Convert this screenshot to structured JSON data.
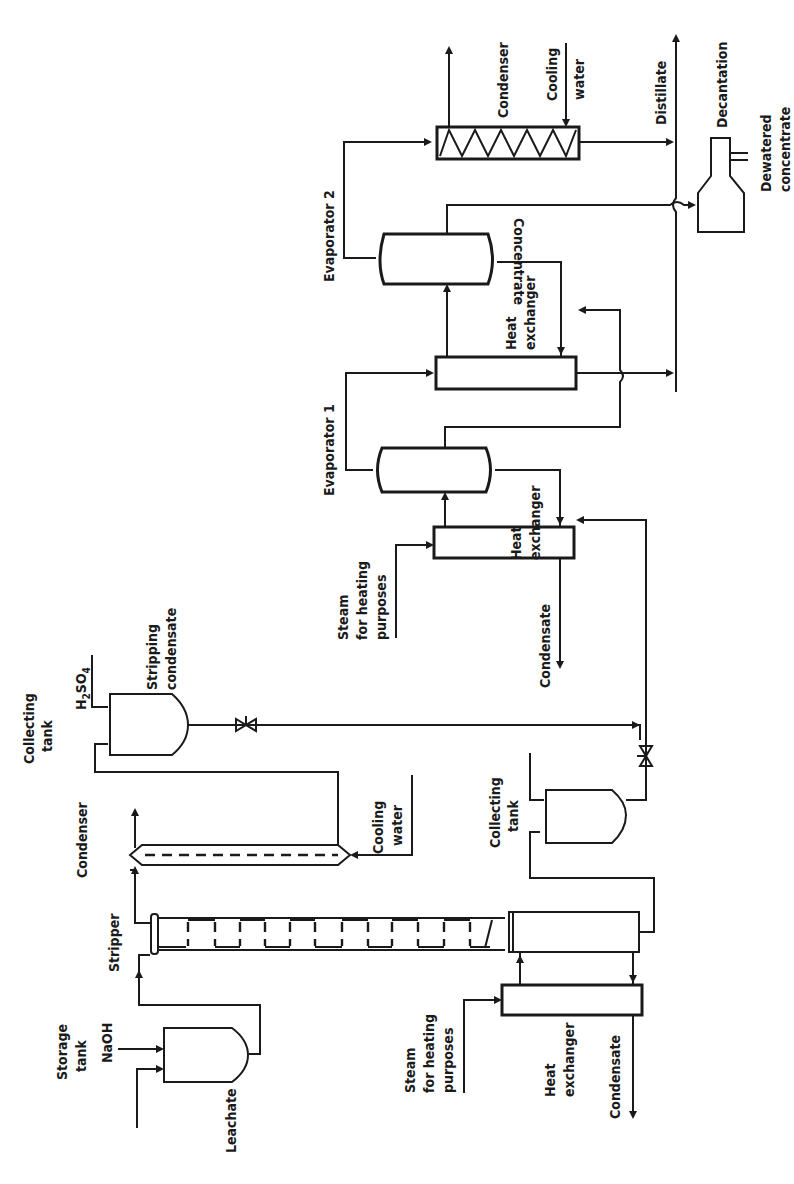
{
  "diagram": {
    "orientation": "rotated-90-clockwise",
    "stroke_color": "#1a1a1a",
    "background": "#ffffff",
    "labels": {
      "storage_tank": "Storage tank",
      "storage_tank_l1": "Storage",
      "storage_tank_l2": "tank",
      "naoh": "NaOH",
      "leachate": "Leachate",
      "stripper": "Stripper",
      "condenser_1": "Condenser",
      "cooling_water_1_l1": "Cooling",
      "cooling_water_1_l2": "water",
      "collecting_tank_1_l1": "Collecting",
      "collecting_tank_1_l2": "tank",
      "h2so4": "H2SO4",
      "stripping_condensate_l1": "Stripping",
      "stripping_condensate_l2": "condensate",
      "steam_1_l1": "Steam",
      "steam_1_l2": "for heating",
      "steam_1_l3": "purposes",
      "heat_exchanger_1_l1": "Heat",
      "heat_exchanger_1_l2": "exchanger",
      "condensate_1": "Condensate",
      "collecting_tank_2_l1": "Collecting",
      "collecting_tank_2_l2": "tank",
      "steam_2_l1": "Steam",
      "steam_2_l2": "for heating",
      "steam_2_l3": "purposes",
      "heat_exchanger_2_l1": "Heat",
      "heat_exchanger_2_l2": "exchanger",
      "condensate_2": "Condensate",
      "evaporator_1": "Evaporator 1",
      "heat_exchanger_3_l1": "Heat",
      "heat_exchanger_3_l2": "exchanger",
      "evaporator_2": "Evaporator 2",
      "concentrate": "Concentrate",
      "condenser_2": "Condenser",
      "cooling_water_2_l1": "Cooling",
      "cooling_water_2_l2": "water",
      "distillate": "Distillate",
      "decantation": "Decantation",
      "dewatered_concentrate_l1": "Dewatered",
      "dewatered_concentrate_l2": "concentrate"
    },
    "units": [
      "Storage tank",
      "Stripper",
      "Condenser",
      "Collecting tank (stripping condensate)",
      "Heat exchanger (stripper reboiler)",
      "Collecting tank",
      "Heat exchanger",
      "Evaporator 1",
      "Heat exchanger",
      "Evaporator 2",
      "Condenser",
      "Decantation"
    ],
    "streams": [
      "Leachate",
      "NaOH",
      "Cooling water",
      "H2SO4",
      "Stripping condensate",
      "Steam for heating purposes",
      "Condensate",
      "Concentrate",
      "Distillate",
      "Dewatered concentrate"
    ]
  }
}
